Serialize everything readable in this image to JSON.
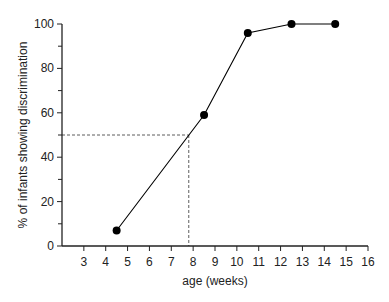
{
  "chart_data": {
    "type": "line",
    "title": "",
    "xlabel": "age (weeks)",
    "ylabel": "% of infants showing discrimination",
    "xlim": [
      2,
      16
    ],
    "ylim": [
      0,
      100
    ],
    "x_ticks": [
      3,
      4,
      5,
      6,
      7,
      8,
      9,
      10,
      11,
      12,
      13,
      14,
      15,
      16
    ],
    "y_ticks": [
      0,
      20,
      40,
      60,
      80,
      100
    ],
    "y_minor_ticks": [
      10,
      30,
      50,
      70,
      90
    ],
    "grid": false,
    "legend": null,
    "series": [
      {
        "name": "discrimination",
        "x": [
          4.5,
          8.5,
          10.5,
          12.5,
          14.5
        ],
        "y": [
          7,
          59,
          96,
          100,
          100
        ],
        "marker": "filled-circle",
        "color": "#000000"
      }
    ],
    "annotations": [
      {
        "type": "dashed-guide",
        "description": "50% threshold",
        "y": 50,
        "x": 7.8
      }
    ]
  }
}
